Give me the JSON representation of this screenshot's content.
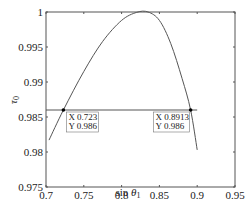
{
  "chart_data": {
    "type": "line",
    "title": "",
    "xlabel": "sin θ1",
    "ylabel": "τ0",
    "xlim": [
      0.7,
      0.95
    ],
    "ylim": [
      0.975,
      1.0
    ],
    "xticks": [
      "0.7",
      "0.75",
      "0.8",
      "0.85",
      "0.9",
      "0.95"
    ],
    "yticks": [
      "0.975",
      "0.98",
      "0.985",
      "0.99",
      "0.995",
      "1"
    ],
    "grid": false,
    "series": [
      {
        "name": "tau0 curve",
        "x": [
          0.704,
          0.723,
          0.75,
          0.775,
          0.8,
          0.82,
          0.835,
          0.85,
          0.865,
          0.88,
          0.8913,
          0.9
        ],
        "y": [
          0.9817,
          0.986,
          0.9915,
          0.9958,
          0.9988,
          0.99995,
          1.0,
          0.9988,
          0.9955,
          0.9905,
          0.986,
          0.9803
        ]
      },
      {
        "name": "threshold line",
        "x": [
          0.7,
          0.9
        ],
        "y": [
          0.986,
          0.986
        ]
      }
    ],
    "annotations": [
      {
        "x": 0.723,
        "y": 0.986,
        "label_x": "X 0.723",
        "label_y": "Y 0.986"
      },
      {
        "x": 0.8913,
        "y": 0.986,
        "label_x": "X 0.8913",
        "label_y": "Y 0.986"
      }
    ]
  }
}
